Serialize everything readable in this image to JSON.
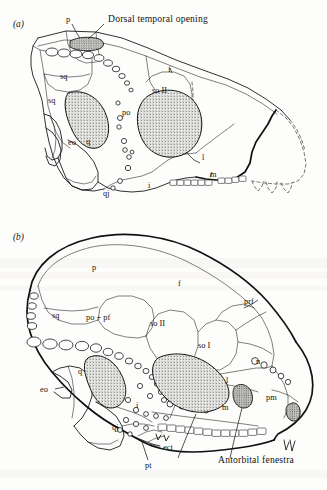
{
  "figure": {
    "background_color": "#fdfdfc",
    "ink_color": "#1a1a1a",
    "stipple_color": "#8a8a86"
  },
  "panel_a": {
    "id": "(a)",
    "callouts": [
      {
        "key": "dorsal_temporal_opening",
        "text": "Dorsal temporal opening"
      }
    ],
    "labels": [
      {
        "key": "p",
        "text": "p"
      },
      {
        "key": "sq1",
        "text": "sq"
      },
      {
        "key": "sq2",
        "text": "sq"
      },
      {
        "key": "f",
        "text": "f"
      },
      {
        "key": "so2",
        "text": "so II"
      },
      {
        "key": "po",
        "text": "po"
      },
      {
        "key": "eo",
        "text": "eo"
      },
      {
        "key": "q",
        "text": "q"
      },
      {
        "key": "qj",
        "text": "qj"
      },
      {
        "key": "i",
        "text": "i"
      },
      {
        "key": "l",
        "text": "l"
      },
      {
        "key": "m",
        "text": "m"
      }
    ]
  },
  "panel_b": {
    "id": "(b)",
    "callouts": [
      {
        "key": "antorbital_fenestra",
        "text": "Antorbital fenestra"
      }
    ],
    "labels": [
      {
        "key": "p",
        "text": "p"
      },
      {
        "key": "f",
        "text": "f"
      },
      {
        "key": "sq",
        "text": "sq"
      },
      {
        "key": "po_pf",
        "text": "po + pf"
      },
      {
        "key": "so2",
        "text": "so II"
      },
      {
        "key": "so1",
        "text": "so I"
      },
      {
        "key": "prf",
        "text": "prf"
      },
      {
        "key": "n",
        "text": "n"
      },
      {
        "key": "q",
        "text": "q"
      },
      {
        "key": "eo",
        "text": "eo"
      },
      {
        "key": "qj",
        "text": "qj"
      },
      {
        "key": "i",
        "text": "i"
      },
      {
        "key": "l",
        "text": "l"
      },
      {
        "key": "m",
        "text": "m"
      },
      {
        "key": "pm",
        "text": "pm"
      },
      {
        "key": "ect",
        "text": "ect"
      },
      {
        "key": "pt",
        "text": "pt"
      }
    ]
  }
}
